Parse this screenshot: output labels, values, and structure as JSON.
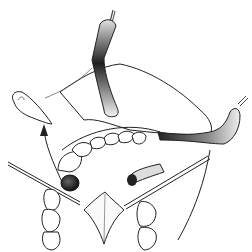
{
  "illustration": {
    "subject": "surgical illustration of oral procedure with retractors",
    "style": "black line drawing with grey shaded instruments",
    "colors": {
      "background": "#ffffff",
      "line": "#222222",
      "retractor_dark": "#2a2a2a",
      "retractor_light": "#e8e8e8",
      "tissue_mark": "#333333"
    },
    "elements": [
      "upper-retractor",
      "right-retractor",
      "soft-palate-flap",
      "upper-dental-arch",
      "lower-left-teeth",
      "lower-right-teeth",
      "left-instrument",
      "right-instrument",
      "incision-diamond",
      "excised-tissue",
      "removal-arrow",
      "dark-nodule",
      "vessel-roll"
    ]
  }
}
